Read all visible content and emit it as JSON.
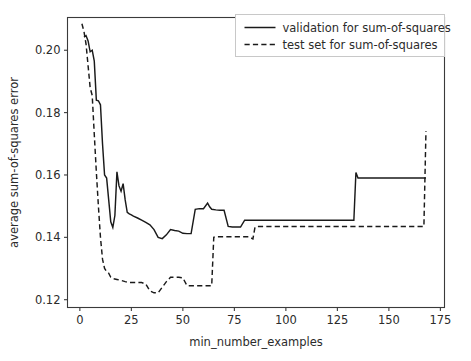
{
  "chart_data": {
    "type": "line",
    "title": "",
    "xlabel": "min_number_examples",
    "ylabel": "average sum-of-squares error",
    "xlim": [
      -6,
      177
    ],
    "ylim": [
      0.1175,
      0.2105
    ],
    "grid": false,
    "legend_position": "upper right",
    "xticks": [
      0,
      25,
      50,
      75,
      100,
      125,
      150,
      175
    ],
    "xtick_labels": [
      "0",
      "25",
      "50",
      "75",
      "100",
      "125",
      "150",
      "175"
    ],
    "yticks": [
      0.12,
      0.14,
      0.16,
      0.18,
      0.2
    ],
    "ytick_labels": [
      "0.12",
      "0.14",
      "0.16",
      "0.18",
      "0.20"
    ],
    "line_color": "#1a1a1a",
    "series": [
      {
        "name": "validation for sum-of-squares",
        "style": "solid",
        "x": [
          2,
          3,
          4,
          5,
          6,
          7,
          8,
          9,
          10,
          11,
          12,
          13,
          14,
          15,
          16,
          17,
          18,
          19,
          20,
          21,
          22,
          23,
          24,
          25,
          26,
          28,
          30,
          32,
          34,
          36,
          38,
          40,
          42,
          44,
          46,
          48,
          50,
          52,
          54,
          56,
          58,
          60,
          62,
          63,
          64,
          66,
          68,
          70,
          72,
          74,
          76,
          78,
          80,
          85,
          95,
          110,
          125,
          133,
          134,
          135,
          150,
          168
        ],
        "y": [
          0.2042,
          0.2047,
          0.203,
          0.1995,
          0.2,
          0.1965,
          0.184,
          0.1838,
          0.1825,
          0.17,
          0.16,
          0.159,
          0.152,
          0.145,
          0.1432,
          0.147,
          0.161,
          0.1565,
          0.1548,
          0.1572,
          0.152,
          0.148,
          0.1475,
          0.1472,
          0.1468,
          0.1462,
          0.1455,
          0.1448,
          0.144,
          0.1425,
          0.14,
          0.1396,
          0.1408,
          0.1425,
          0.1422,
          0.142,
          0.1413,
          0.1412,
          0.1412,
          0.149,
          0.1492,
          0.1492,
          0.151,
          0.1498,
          0.149,
          0.1488,
          0.1487,
          0.1487,
          0.1435,
          0.1433,
          0.1433,
          0.1433,
          0.1455,
          0.1455,
          0.1455,
          0.1455,
          0.1455,
          0.1455,
          0.1608,
          0.159,
          0.159,
          0.159
        ]
      },
      {
        "name": "test set for sum-of-squares",
        "style": "dashed",
        "x": [
          1,
          2,
          3,
          4,
          5,
          6,
          7,
          8,
          9,
          10,
          11,
          12,
          13,
          14,
          15,
          16,
          18,
          20,
          22,
          24,
          26,
          28,
          30,
          32,
          34,
          36,
          38,
          40,
          42,
          44,
          46,
          48,
          50,
          52,
          54,
          58,
          62,
          64,
          65,
          66,
          70,
          74,
          78,
          82,
          84,
          85,
          86,
          88,
          95,
          110,
          130,
          150,
          167,
          168
        ],
        "y": [
          0.2085,
          0.206,
          0.202,
          0.195,
          0.188,
          0.1855,
          0.173,
          0.161,
          0.15,
          0.14,
          0.133,
          0.13,
          0.129,
          0.1285,
          0.1272,
          0.1268,
          0.1265,
          0.1262,
          0.1258,
          0.1255,
          0.1255,
          0.1255,
          0.1255,
          0.125,
          0.1228,
          0.1222,
          0.1222,
          0.124,
          0.1258,
          0.1272,
          0.1272,
          0.1272,
          0.127,
          0.1245,
          0.1245,
          0.1245,
          0.1245,
          0.1245,
          0.14,
          0.1402,
          0.1402,
          0.1402,
          0.1402,
          0.1402,
          0.1395,
          0.1432,
          0.1435,
          0.1435,
          0.1435,
          0.1435,
          0.1435,
          0.1435,
          0.1435,
          0.174
        ]
      }
    ]
  },
  "legend": {
    "entries": [
      {
        "label": "validation for sum-of-squares",
        "style": "solid"
      },
      {
        "label": "test set for sum-of-squares",
        "style": "dashed"
      }
    ]
  },
  "axes": {
    "x_title": "min_number_examples",
    "y_title": "average sum-of-squares error"
  }
}
